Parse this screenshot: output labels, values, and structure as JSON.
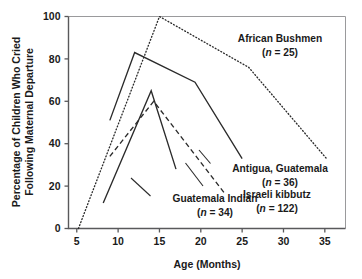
{
  "chart_data": {
    "type": "line",
    "title": "",
    "xlabel": "Age (Months)",
    "ylabel": "Percentage of Children Who Cried Following Maternal Departure",
    "ylabel_line1": "Percentage of Children Who Cried",
    "ylabel_line2": "Following Maternal Departure",
    "xlim": [
      4,
      37.5
    ],
    "ylim": [
      0,
      100
    ],
    "xticks": [
      5,
      10,
      15,
      20,
      25,
      30,
      35
    ],
    "xtick_labels": [
      "5",
      "10",
      "15",
      "20",
      "25",
      "30",
      "35"
    ],
    "yticks": [
      0,
      20,
      40,
      60,
      80,
      100
    ],
    "ytick_labels": [
      "0",
      "20",
      "40",
      "60",
      "80",
      "100"
    ],
    "grid": false,
    "legend_position": "inline-annotations",
    "series": [
      {
        "name": "African Bushmen",
        "n": 25,
        "style": "dotted",
        "x": [
          5.2,
          15.0,
          25.8,
          35.2
        ],
        "y": [
          0,
          100,
          76,
          33
        ]
      },
      {
        "name": "Antigua, Guatemala",
        "n": 36,
        "style": "solid",
        "x": [
          9.0,
          12.0,
          19.3,
          25.0
        ],
        "y": [
          51,
          83,
          69,
          33
        ]
      },
      {
        "name": "Guatemala Indian",
        "n": 34,
        "style": "solid",
        "x": [
          8.2,
          14.0,
          17.0
        ],
        "y": [
          12,
          65,
          28
        ]
      },
      {
        "name": "Israeli kibbutz",
        "n": 122,
        "style": "dashed",
        "x": [
          9.0,
          14.3,
          22.8
        ],
        "y": [
          34,
          60,
          17
        ]
      }
    ],
    "annotations": [
      {
        "id": "african-bushmen",
        "label": "African Bushmen",
        "sub": "(n = 25)",
        "n_value": "25"
      },
      {
        "id": "antigua-guatemala",
        "label": "Antigua, Guatemala",
        "sub": "(n = 36)",
        "n_value": "36"
      },
      {
        "id": "guatemala-indian",
        "label": "Guatemala Indian",
        "sub": "(n = 34)",
        "n_value": "34"
      },
      {
        "id": "israeli-kibbutz",
        "label": "Israeli kibbutz",
        "sub": "(n = 122)",
        "n_value": "122"
      }
    ],
    "colors": {
      "line": "#2b2b2b",
      "axis": "#59595b",
      "frame": "#9a9a9c",
      "text": "#1a1a1a",
      "background": "#ffffff"
    }
  }
}
